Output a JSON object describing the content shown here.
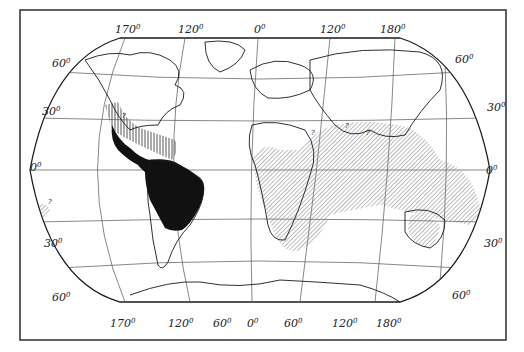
{
  "map": {
    "projection": "Eckert-type world projection",
    "colors": {
      "frame": "#3a3a3a",
      "graticule": "#555555",
      "coast": "#1a1a1a",
      "range_solid": "#111111",
      "range_hatch": "#888888",
      "background": "#ffffff"
    },
    "legend_patterns": [
      {
        "id": "solid",
        "description": "solid black fill — tropical Central & South America"
      },
      {
        "id": "vertical-hatch",
        "description": "vertical hatching — Mexico / Caribbean margin"
      },
      {
        "id": "diagonal-hatch",
        "description": "diagonal hatching — Africa, South & SE Asia, Australasia, Pacific islands, S Atlantic patch"
      }
    ],
    "top_longitude_labels": [
      {
        "deg": "170",
        "unit": "0"
      },
      {
        "deg": "120",
        "unit": "0"
      },
      {
        "deg": "0",
        "unit": "0"
      },
      {
        "deg": "120",
        "unit": "0"
      },
      {
        "deg": "180",
        "unit": "0"
      }
    ],
    "bottom_longitude_labels": [
      {
        "deg": "170",
        "unit": "0"
      },
      {
        "deg": "120",
        "unit": "0"
      },
      {
        "deg": "60",
        "unit": "0"
      },
      {
        "deg": "0",
        "unit": "0"
      },
      {
        "deg": "60",
        "unit": "0"
      },
      {
        "deg": "120",
        "unit": "0"
      },
      {
        "deg": "180",
        "unit": "0"
      }
    ],
    "left_latitude_labels": [
      {
        "deg": "60",
        "unit": "0"
      },
      {
        "deg": "30",
        "unit": "0"
      },
      {
        "deg": "0",
        "unit": "0"
      },
      {
        "deg": "30",
        "unit": "0"
      },
      {
        "deg": "60",
        "unit": "0"
      }
    ],
    "right_latitude_labels": [
      {
        "deg": "60",
        "unit": "0"
      },
      {
        "deg": "30",
        "unit": "0"
      },
      {
        "deg": "0",
        "unit": "0"
      },
      {
        "deg": "30",
        "unit": "0"
      },
      {
        "deg": "60",
        "unit": "0"
      }
    ],
    "uncertain_marker": "?"
  }
}
